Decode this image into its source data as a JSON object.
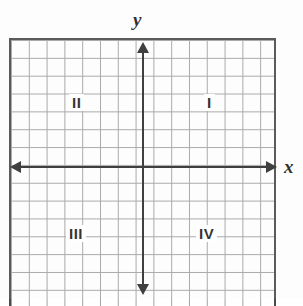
{
  "figure": {
    "background_color": "#ffffff",
    "grid_color": "#9a9a9a",
    "border_color": "#3b3b3b",
    "axis_color": "#2b2b2b",
    "text_color": "#1a1a1a"
  },
  "axes": {
    "x_label": "x",
    "y_label": "y",
    "x_arrow_left": "arrow-left",
    "x_arrow_right": "arrow-right",
    "y_arrow_up": "arrow-up",
    "y_arrow_down": "arrow-down"
  },
  "quadrants": [
    {
      "id": "I",
      "label": "I",
      "position": "upper-right"
    },
    {
      "id": "II",
      "label": "II",
      "position": "upper-left"
    },
    {
      "id": "III",
      "label": "III",
      "position": "lower-left"
    },
    {
      "id": "IV",
      "label": "IV",
      "position": "lower-right"
    }
  ],
  "chart_data": {
    "type": "scatter",
    "title": "",
    "xlabel": "x",
    "ylabel": "y",
    "grid": true,
    "legend": null,
    "x": [],
    "y": [],
    "series": [],
    "annotations": [
      {
        "text": "I",
        "x": 4,
        "y": 4
      },
      {
        "text": "II",
        "x": -4,
        "y": 4
      },
      {
        "text": "III",
        "x": -4,
        "y": -4
      },
      {
        "text": "IV",
        "x": 4,
        "y": -4
      }
    ],
    "grid_columns": 15,
    "grid_rows": 15,
    "origin_cell_x": 7,
    "origin_cell_y": 7,
    "xlim": [
      -7.5,
      7.5
    ],
    "ylim": [
      -7.5,
      7.5
    ],
    "tick_labels_x": [],
    "tick_labels_y": []
  }
}
